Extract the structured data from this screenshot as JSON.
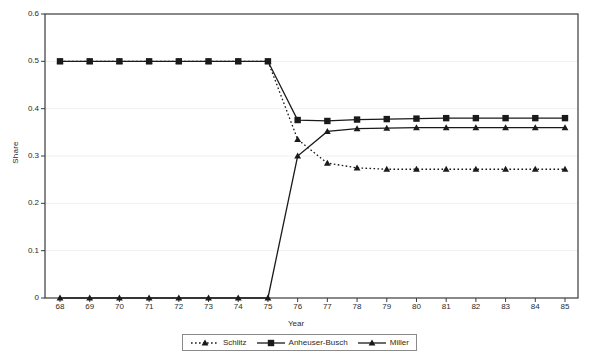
{
  "chart_data": {
    "type": "line",
    "title": "",
    "xlabel": "Year",
    "ylabel": "Share",
    "x": [
      68,
      69,
      70,
      71,
      72,
      73,
      74,
      75,
      76,
      77,
      78,
      79,
      80,
      81,
      82,
      83,
      84,
      85
    ],
    "x_tick_labels": [
      "68",
      "69",
      "70",
      "71",
      "72",
      "73",
      "74",
      "75",
      "76",
      "77",
      "78",
      "79",
      "80",
      "81",
      "82",
      "83",
      "84",
      "85"
    ],
    "y_tick_labels": [
      "0",
      "0.1",
      "0.2",
      "0.3",
      "0.4",
      "0.5",
      "0.6"
    ],
    "y_ticks": [
      0,
      0.1,
      0.2,
      0.3,
      0.4,
      0.5,
      0.6
    ],
    "ylim": [
      0,
      0.6
    ],
    "xlim": [
      68,
      85
    ],
    "grid": true,
    "legend_position": "bottom",
    "series": [
      {
        "name": "Schlitz",
        "line_style": "dotted",
        "marker": "triangle",
        "color": "#1a1a1a",
        "values": [
          0.5,
          0.5,
          0.5,
          0.5,
          0.5,
          0.5,
          0.5,
          0.5,
          0.335,
          0.285,
          0.275,
          0.272,
          0.272,
          0.272,
          0.272,
          0.272,
          0.272,
          0.272
        ]
      },
      {
        "name": "Anheuser-Busch",
        "line_style": "solid",
        "marker": "square",
        "color": "#1a1a1a",
        "values": [
          0.5,
          0.5,
          0.5,
          0.5,
          0.5,
          0.5,
          0.5,
          0.5,
          0.376,
          0.374,
          0.377,
          0.378,
          0.379,
          0.38,
          0.38,
          0.38,
          0.38,
          0.38
        ]
      },
      {
        "name": "Miller",
        "line_style": "solid",
        "marker": "triangle",
        "color": "#1a1a1a",
        "values": [
          0,
          0,
          0,
          0,
          0,
          0,
          0,
          0,
          0.3,
          0.352,
          0.358,
          0.359,
          0.36,
          0.36,
          0.36,
          0.36,
          0.36,
          0.36
        ]
      }
    ]
  },
  "legend": {
    "items": [
      {
        "label": "Schlitz"
      },
      {
        "label": "Anheuser-Busch"
      },
      {
        "label": "Miller"
      }
    ]
  },
  "axes": {
    "x_title": "Year",
    "y_title": "Share"
  },
  "colors": {
    "ink": "#1a1a1a",
    "grid": "#f0f0f0",
    "axis": "#3a3a3a",
    "legend_border": "#8a8a8a"
  }
}
